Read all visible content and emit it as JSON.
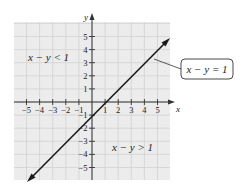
{
  "figure": {
    "axis_x_label": "x",
    "axis_y_label": "y",
    "region_upper_label": "x − y < 1",
    "region_lower_label": "x − y > 1",
    "boundary_callout": "x − y = 1",
    "colors": {
      "background": "#ffffff",
      "grid_fill": "#ececec",
      "grid_line": "#d2d2d2",
      "axis": "#333333",
      "line": "#1a1a1a"
    }
  },
  "chart_data": {
    "type": "line",
    "title": "",
    "xlabel": "x",
    "ylabel": "y",
    "xlim": [
      -6,
      6
    ],
    "ylim": [
      -6,
      6
    ],
    "grid": true,
    "x_ticks": [
      -5,
      -4,
      -3,
      -2,
      -1,
      1,
      2,
      3,
      4,
      5
    ],
    "y_ticks": [
      -5,
      -4,
      -3,
      -2,
      -1,
      1,
      2,
      3,
      4,
      5
    ],
    "x_tick_labels": [
      "−5",
      "−4",
      "−3",
      "−2",
      "−1",
      "1",
      "2",
      "3",
      "4",
      "5"
    ],
    "y_tick_labels": [
      "−5",
      "−4",
      "−3",
      "−2",
      "−1",
      "1",
      "2",
      "3",
      "4",
      "5"
    ],
    "series": [
      {
        "name": "x − y = 1",
        "equation": "y = x − 1",
        "x": [
          -4.9,
          5.9
        ],
        "y": [
          -5.9,
          4.9
        ],
        "arrows": "both"
      }
    ],
    "annotations": [
      {
        "text": "x − y < 1",
        "x": -3.7,
        "y": 3.5,
        "region": "above line"
      },
      {
        "text": "x − y > 1",
        "x": 3.2,
        "y": -2.7,
        "region": "below line"
      },
      {
        "text": "x − y = 1",
        "type": "callout",
        "points_to": [
          4.7,
          3.7
        ]
      }
    ]
  }
}
